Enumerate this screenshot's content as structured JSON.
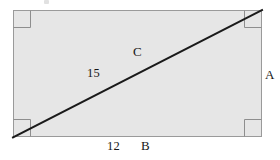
{
  "figure": {
    "colors": {
      "page_background": "#ffffff",
      "rectangle_fill": "#e6e6e6",
      "rectangle_stroke": "#9a9a9a",
      "corner_marker_stroke": "#8e8e8e",
      "diagonal_stroke": "#1a1a1a",
      "label_text": "#171717"
    },
    "rectangle": {
      "x": 13,
      "y": 10,
      "width": 249,
      "height": 127,
      "stroke_width": 1
    },
    "diagonal": {
      "x1": 13,
      "y1": 137,
      "x2": 262,
      "y2": 10,
      "stroke_width": 2
    },
    "corner_markers": {
      "size": 17,
      "stroke_width": 1,
      "corners": [
        "top-left",
        "top-right",
        "bottom-left",
        "bottom-right"
      ]
    },
    "labels": {
      "hypotenuse_value": "15",
      "hypotenuse_name": "C",
      "side_a_name": "A",
      "base_value": "12",
      "base_name": "B"
    }
  }
}
